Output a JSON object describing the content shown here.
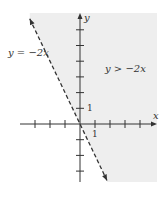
{
  "chart_data": {
    "type": "line",
    "title": "",
    "xlabel": "x",
    "ylabel": "y",
    "xlim": [
      -4,
      5
    ],
    "ylim": [
      -4,
      7
    ],
    "x_ticks": [
      -3,
      -2,
      -1,
      1,
      2,
      3,
      4
    ],
    "y_ticks": [
      -3,
      -2,
      -1,
      1,
      2,
      3,
      4,
      5,
      6
    ],
    "tick_labels": {
      "x": "1",
      "y": "1"
    },
    "grid": false,
    "boundary": {
      "name": "y = -2x",
      "equation_label": "y = −2x",
      "slope": -2,
      "intercept": 0,
      "style": "dashed",
      "x_range": [
        -3.35,
        1.8
      ]
    },
    "shaded_region": {
      "inequality": "y > -2x",
      "label": "y > −2x",
      "side": "above-right",
      "color": "#eeeeee"
    },
    "colors": {
      "axis": "#333333",
      "line": "#333333",
      "shade": "#eeeeee"
    }
  }
}
